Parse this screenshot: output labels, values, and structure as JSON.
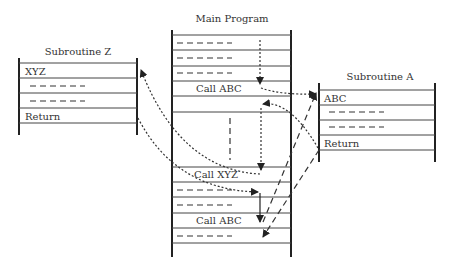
{
  "main_program": {
    "title": "Main Program",
    "rows": [
      "- - - -",
      "- - - -",
      "- - - -",
      "Call ABC",
      "",
      "",
      "Call XYZ",
      "- - - -",
      "- - - -",
      "Call ABC",
      "- - - -"
    ],
    "labels": {
      "call_abc_1": "Call ABC",
      "call_xyz": "Call XYZ",
      "call_abc_2": "Call ABC"
    }
  },
  "subroutine_z": {
    "title": "Subroutine Z",
    "entry": "XYZ",
    "return": "Return"
  },
  "subroutine_a": {
    "title": "Subroutine A",
    "entry": "ABC",
    "return": "Return"
  },
  "colors": {
    "line": "#222222",
    "text": "#333333",
    "background": "#ffffff"
  }
}
